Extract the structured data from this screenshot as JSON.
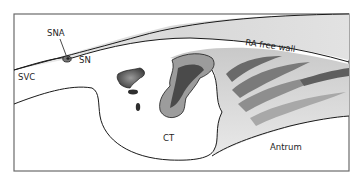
{
  "diagram": {
    "type": "anatomical-illustration",
    "style": "grayscale pen-and-stipple drawing inside rectangular frame",
    "labels": {
      "sna": "SNA",
      "sn": "SN",
      "svc": "SVC",
      "ra_free_wall": "RA free wall",
      "ct": "CT",
      "antrum": "Antrum"
    },
    "colors": {
      "frame": "#6b6b6b",
      "outline": "#1a1a1a",
      "light_shade": "#e4e4e4",
      "mid_shade": "#b8b8b8",
      "dark_shade": "#5a5a5a",
      "background": "#ffffff"
    }
  }
}
